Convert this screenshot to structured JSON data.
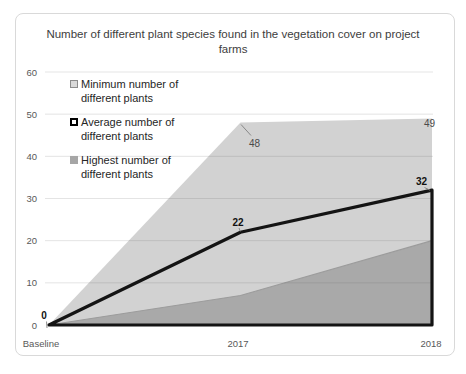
{
  "chart_data": {
    "type": "area",
    "title": "Number of different plant species found in the vegetation cover on project farms",
    "categories": [
      "Baseline",
      "2017",
      "2018"
    ],
    "series": [
      {
        "name": "Minimum number of different plants",
        "values": [
          0,
          7,
          20
        ],
        "labels": [
          "",
          "",
          ""
        ]
      },
      {
        "name": "Average number of different plants",
        "values": [
          0,
          22,
          32
        ],
        "labels": [
          "0",
          "22",
          "32"
        ]
      },
      {
        "name": "Highest number of different plants",
        "values": [
          0,
          48,
          49
        ],
        "labels": [
          "",
          "48",
          "49"
        ]
      }
    ],
    "xlabel": "",
    "ylabel": "",
    "ylim": [
      0,
      60
    ],
    "ytick_step": 10,
    "grid": true,
    "legend_position": "inside-top-left"
  },
  "colors": {
    "highest_area_fill": "#d2d2d2",
    "minimum_area_fill": "#a9a9a9",
    "minimum_area_edge": "#9c9c9c",
    "average_line": "#141414",
    "gridline": "rgba(85,85,85,0.16)",
    "axis_text": "#595959",
    "data_label_average": "#111111",
    "data_label_highest": "#4a4a4a",
    "frame_border": "#d9d9d9",
    "leader_line": "#7f7f7f"
  },
  "legend": {
    "markers": [
      {
        "name": "minimum-marker",
        "fill": "#d9d9d9",
        "border": "#8c8c8c",
        "border_width": 1
      },
      {
        "name": "average-marker",
        "fill": "#ffffff",
        "border": "#000000",
        "border_width": 2
      },
      {
        "name": "highest-marker",
        "fill": "#a6a6a6",
        "border": "#a6a6a6",
        "border_width": 1
      }
    ]
  }
}
